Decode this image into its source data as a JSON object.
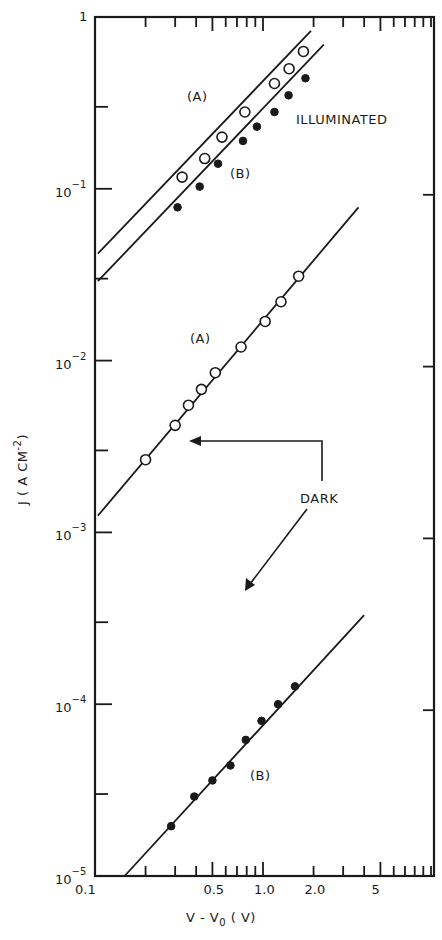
{
  "chart_data": {
    "type": "scatter",
    "title": "",
    "xlabel": "V - V0 (V)",
    "ylabel": "J ( A CM^-2 )",
    "xscale": "log",
    "yscale": "log",
    "xlim": [
      0.1,
      10.5
    ],
    "ylim": [
      1e-05,
      1
    ],
    "grid": false,
    "x_tick_labels": [
      "0.1",
      "0.5",
      "1.0",
      "2.0",
      "5"
    ],
    "x_tick_values": [
      0.1,
      0.5,
      1.0,
      2.0,
      5
    ],
    "y_tick_labels": [
      "1",
      "10^-1",
      "10^-2",
      "10^-3",
      "10^-4",
      "10^-5"
    ],
    "y_tick_values": [
      1,
      0.1,
      0.01,
      0.001,
      0.0001,
      1e-05
    ],
    "annotations": [
      {
        "text": "ILLUMINATED",
        "x": 2.6,
        "y": 0.32
      },
      {
        "text": "DARK",
        "x": 2.3,
        "y": 0.0009
      },
      {
        "text": "(A)",
        "x": 0.35,
        "y": 0.28,
        "group": "illuminated"
      },
      {
        "text": "(B)",
        "x": 0.62,
        "y": 0.095,
        "group": "illuminated"
      },
      {
        "text": "(A)",
        "x": 0.5,
        "y": 0.0135,
        "group": "dark"
      },
      {
        "text": "(B)",
        "x": 1.35,
        "y": 4.5e-05,
        "group": "dark"
      }
    ],
    "series": [
      {
        "name": "Illuminated (A)",
        "marker": "open-circle",
        "x": [
          0.33,
          0.45,
          0.57,
          0.78,
          1.17,
          1.43,
          1.74
        ],
        "y": [
          0.117,
          0.15,
          0.2,
          0.28,
          0.41,
          0.5,
          0.63
        ],
        "fit_line": {
          "x": [
            0.104,
            1.93
          ],
          "y": [
            0.042,
            0.83
          ]
        }
      },
      {
        "name": "Illuminated (B)",
        "marker": "filled-circle",
        "x": [
          0.31,
          0.42,
          0.54,
          0.76,
          0.92,
          1.17,
          1.42,
          1.79
        ],
        "y": [
          0.078,
          0.103,
          0.14,
          0.19,
          0.23,
          0.28,
          0.35,
          0.44
        ],
        "fit_line": {
          "x": [
            0.104,
            2.3
          ],
          "y": [
            0.029,
            0.69
          ]
        }
      },
      {
        "name": "Dark (A)",
        "marker": "open-circle",
        "x": [
          0.2,
          0.3,
          0.36,
          0.43,
          0.52,
          0.74,
          1.03,
          1.28,
          1.63
        ],
        "y": [
          0.00265,
          0.0042,
          0.0055,
          0.0068,
          0.0085,
          0.012,
          0.0169,
          0.022,
          0.031
        ],
        "fit_line": {
          "x": [
            0.104,
            3.7
          ],
          "y": [
            0.00125,
            0.078
          ]
        }
      },
      {
        "name": "Dark (B)",
        "marker": "filled-circle",
        "x": [
          0.284,
          0.39,
          0.5,
          0.64,
          0.79,
          0.98,
          1.23,
          1.55
        ],
        "y": [
          1.95e-05,
          2.9e-05,
          3.6e-05,
          4.4e-05,
          6.2e-05,
          8e-05,
          0.0001,
          0.000127
        ],
        "fit_line": {
          "x": [
            0.15,
            4.0
          ],
          "y": [
            1e-05,
            0.00033
          ]
        }
      }
    ]
  },
  "labels": {
    "x_axis_title_main": "V - V",
    "x_axis_title_sub": "0",
    "x_axis_title_unit": " ( V)",
    "y_axis_title": "J ( A  CM",
    "y_axis_title_sup": "-2",
    "y_axis_title_end": ")",
    "illuminated": "ILLUMINATED",
    "dark": "DARK",
    "ill_a": "(A)",
    "ill_b": "(B)",
    "dark_a": "(A)",
    "dark_b": "(B)"
  }
}
